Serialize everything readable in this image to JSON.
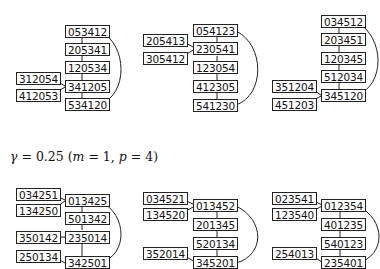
{
  "caption": {
    "gamma": "γ",
    "text": " = 0.25 (",
    "m": "m",
    "m_val": " = 1, ",
    "p": "p",
    "p_val": " = 4)"
  },
  "top_row": [
    {
      "chain": [
        "053412",
        "205341",
        "120534",
        "341205",
        "534120"
      ],
      "side": [
        "312054",
        "412053"
      ]
    },
    {
      "chain": [
        "054123",
        "230541",
        "123054",
        "412305",
        "541230"
      ],
      "side": [
        "205413",
        "305412"
      ]
    },
    {
      "chain": [
        "034512",
        "203451",
        "120345",
        "512034",
        "345120"
      ],
      "side": [
        "351204",
        "451203"
      ]
    }
  ],
  "bottom_row": [
    {
      "chain": [
        "013425",
        "501342",
        "235014",
        "342501"
      ],
      "side": [
        "034251",
        "134250",
        "350142",
        "250134"
      ]
    },
    {
      "chain": [
        "013452",
        "201345",
        "520134",
        "345201"
      ],
      "side": [
        "034521",
        "134520",
        "352014"
      ]
    },
    {
      "chain": [
        "012354",
        "401235",
        "540123",
        "235401"
      ],
      "side": [
        "023541",
        "123540",
        "254013"
      ]
    }
  ]
}
